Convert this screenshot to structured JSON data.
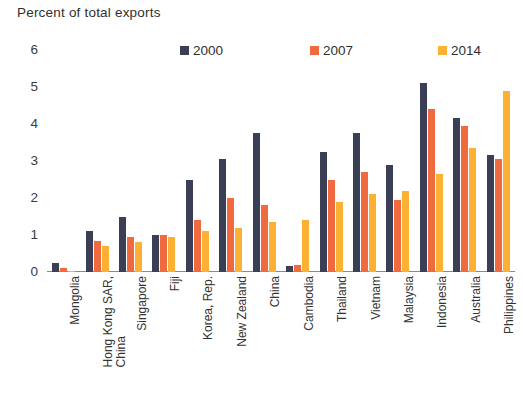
{
  "chart_data": {
    "type": "bar",
    "title": "Percent of total exports",
    "xlabel": "",
    "ylabel": "",
    "ylim": [
      0,
      6
    ],
    "yticks": [
      0,
      1,
      2,
      3,
      4,
      5,
      6
    ],
    "grid": false,
    "legend_position": "top",
    "categories": [
      "Mongolia",
      "Hong Kong SAR,\nChina",
      "Singapore",
      "Fiji",
      "Korea, Rep.",
      "New Zealand",
      "China",
      "Cambodia",
      "Thailand",
      "Vietnam",
      "Malaysia",
      "Indonesia",
      "Australia",
      "Philippines"
    ],
    "series": [
      {
        "name": "2000",
        "color": "#3b3f55",
        "values": [
          0.25,
          1.1,
          1.5,
          1.0,
          2.5,
          3.05,
          3.75,
          0.15,
          3.25,
          3.75,
          2.9,
          5.1,
          4.15,
          3.15
        ]
      },
      {
        "name": "2007",
        "color": "#f0693f",
        "values": [
          0.1,
          0.85,
          0.95,
          1.0,
          1.4,
          2.0,
          1.8,
          0.2,
          2.5,
          2.7,
          1.95,
          4.4,
          3.95,
          3.05
        ]
      },
      {
        "name": "2014",
        "color": "#fcb034",
        "values": [
          0.02,
          0.7,
          0.8,
          0.95,
          1.1,
          1.2,
          1.35,
          1.4,
          1.9,
          2.1,
          2.2,
          2.65,
          3.35,
          4.9
        ]
      }
    ]
  },
  "legend": {
    "entries": [
      {
        "label": "2000",
        "color": "#3b3f55"
      },
      {
        "label": "2007",
        "color": "#f0693f"
      },
      {
        "label": "2014",
        "color": "#fcb034"
      }
    ]
  }
}
